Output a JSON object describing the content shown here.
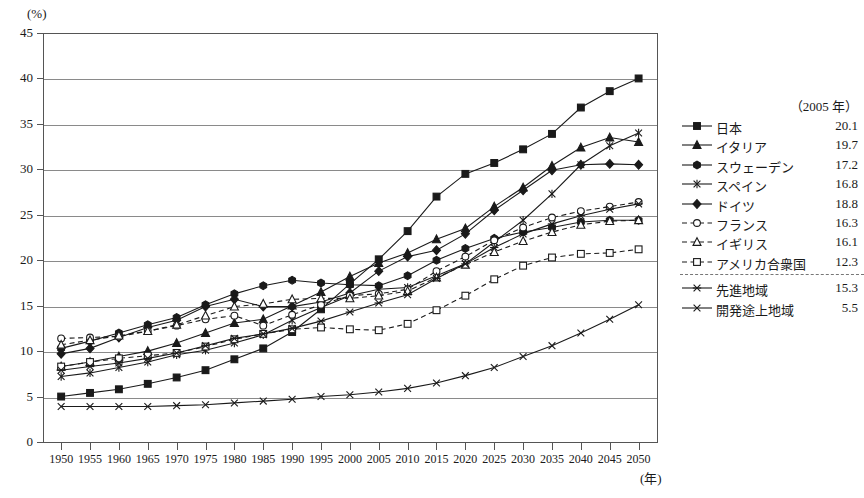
{
  "chart_data": {
    "type": "line",
    "title": "",
    "xlabel": "(年)",
    "ylabel": "(%)",
    "ylim": [
      0,
      45
    ],
    "ytick_values": [
      0,
      5,
      10,
      15,
      20,
      25,
      30,
      35,
      40,
      45
    ],
    "ytick_labels": [
      "0",
      "5",
      "10",
      "15",
      "20",
      "25",
      "30",
      "35",
      "40",
      "45"
    ],
    "grid": "horizontal",
    "legend_position": "right",
    "legend_header": "（2005 年）",
    "x": [
      1950,
      1955,
      1960,
      1965,
      1970,
      1975,
      1980,
      1985,
      1990,
      1995,
      2000,
      2005,
      2010,
      2015,
      2020,
      2025,
      2030,
      2035,
      2040,
      2045,
      2050
    ],
    "categories": [
      "1950",
      "1955",
      "1960",
      "1965",
      "1970",
      "1975",
      "1980",
      "1985",
      "1990",
      "1995",
      "2000",
      "2005",
      "2010",
      "2015",
      "2020",
      "2025",
      "2030",
      "2035",
      "2040",
      "2045",
      "2050"
    ],
    "series": [
      {
        "name": "日本",
        "value_2005": "20.1",
        "marker": "square-filled",
        "line": "solid",
        "values": [
          5.0,
          5.4,
          5.8,
          6.4,
          7.1,
          7.9,
          9.1,
          10.3,
          12.1,
          14.6,
          17.4,
          20.1,
          23.2,
          27.0,
          29.5,
          30.7,
          32.2,
          33.9,
          36.8,
          38.6,
          40.0
        ]
      },
      {
        "name": "イタリア",
        "value_2005": "19.7",
        "marker": "triangle-filled",
        "line": "solid",
        "values": [
          8.3,
          8.8,
          9.4,
          10.0,
          10.9,
          12.0,
          13.1,
          13.5,
          15.0,
          16.5,
          18.2,
          19.7,
          20.8,
          22.3,
          23.5,
          25.9,
          28.0,
          30.4,
          32.4,
          33.5,
          33.0
        ]
      },
      {
        "name": "スウェーデン",
        "value_2005": "17.2",
        "marker": "hexagon-filled",
        "line": "solid",
        "values": [
          10.3,
          11.1,
          12.0,
          12.9,
          13.7,
          15.1,
          16.3,
          17.2,
          17.8,
          17.5,
          17.3,
          17.2,
          18.3,
          20.0,
          21.3,
          22.4,
          23.1,
          23.6,
          24.2,
          24.4,
          24.4
        ]
      },
      {
        "name": "スペイン",
        "value_2005": "16.8",
        "marker": "x-star",
        "line": "solid",
        "values": [
          7.2,
          7.6,
          8.2,
          8.8,
          9.6,
          10.1,
          10.9,
          11.8,
          13.4,
          14.8,
          16.1,
          16.8,
          17.0,
          18.3,
          19.6,
          22.0,
          24.4,
          27.3,
          30.5,
          32.6,
          34.0
        ]
      },
      {
        "name": "ドイツ",
        "value_2005": "18.8",
        "marker": "diamond-filled",
        "line": "solid",
        "values": [
          9.7,
          10.3,
          11.5,
          12.6,
          13.4,
          14.9,
          15.7,
          14.9,
          14.9,
          15.4,
          16.4,
          18.8,
          20.4,
          21.1,
          22.9,
          25.5,
          27.7,
          29.9,
          30.5,
          30.6,
          30.5
        ]
      },
      {
        "name": "フランス",
        "value_2005": "16.3",
        "marker": "circle-open",
        "line": "dashed",
        "values": [
          11.4,
          11.5,
          11.6,
          12.2,
          12.8,
          13.5,
          13.9,
          12.8,
          14.0,
          15.1,
          16.1,
          16.3,
          16.8,
          18.8,
          20.4,
          22.2,
          23.6,
          24.7,
          25.4,
          25.9,
          26.4
        ]
      },
      {
        "name": "イギリス",
        "value_2005": "16.1",
        "marker": "triangle-open",
        "line": "dashed",
        "values": [
          10.7,
          11.2,
          11.7,
          12.2,
          12.9,
          13.9,
          14.9,
          15.2,
          15.7,
          15.8,
          15.8,
          16.1,
          16.6,
          18.1,
          19.5,
          20.9,
          22.1,
          23.1,
          23.9,
          24.3,
          24.4
        ]
      },
      {
        "name": "アメリカ合衆国",
        "value_2005": "12.3",
        "marker": "square-open",
        "line": "dashed",
        "values": [
          8.3,
          8.8,
          9.2,
          9.5,
          9.8,
          10.5,
          11.3,
          11.9,
          12.4,
          12.6,
          12.4,
          12.3,
          13.0,
          14.5,
          16.1,
          17.9,
          19.4,
          20.3,
          20.7,
          20.8,
          21.2
        ]
      },
      {
        "name": "先進地域",
        "value_2005": "15.3",
        "marker": "asterisk",
        "line": "solid",
        "values": [
          7.9,
          8.3,
          8.7,
          9.2,
          9.8,
          10.6,
          11.4,
          11.9,
          12.5,
          13.3,
          14.3,
          15.3,
          16.2,
          18.0,
          19.6,
          21.4,
          22.9,
          24.0,
          24.9,
          25.6,
          26.2
        ]
      },
      {
        "name": "開発途上地域",
        "value_2005": "5.5",
        "marker": "x-mark",
        "line": "solid",
        "values": [
          3.9,
          3.9,
          3.9,
          3.9,
          4.0,
          4.1,
          4.3,
          4.5,
          4.7,
          5.0,
          5.2,
          5.5,
          5.9,
          6.5,
          7.3,
          8.2,
          9.4,
          10.6,
          12.0,
          13.5,
          15.1
        ]
      }
    ]
  }
}
